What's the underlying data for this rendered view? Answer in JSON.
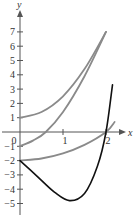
{
  "chart_data": {
    "type": "line",
    "title": "",
    "xlabel": "x",
    "ylabel": "y",
    "xlim": [
      0,
      2.3
    ],
    "ylim": [
      -5.5,
      7.8
    ],
    "x_ticks": [
      0,
      1,
      2
    ],
    "x_tick_labels": [
      "0",
      "1",
      "2"
    ],
    "y_ticks": [
      -5,
      -4,
      -3,
      -2,
      -1,
      1,
      2,
      3,
      4,
      5,
      6,
      7
    ],
    "y_tick_labels": [
      "−5",
      "−4",
      "−3",
      "−2",
      "−1",
      "1",
      "2",
      "3",
      "4",
      "5",
      "6",
      "7"
    ],
    "grid": false,
    "legend": null,
    "series": [
      {
        "name": "gray curve starting at 1",
        "color": "#8a8a8a",
        "points": [
          [
            0,
            1
          ],
          [
            0.5,
            1.4
          ],
          [
            1,
            2.5
          ],
          [
            1.5,
            4.4
          ],
          [
            2,
            7
          ]
        ]
      },
      {
        "name": "gray curve starting at -1",
        "color": "#8a8a8a",
        "points": [
          [
            0,
            -1
          ],
          [
            0.3,
            -0.6
          ],
          [
            0.6,
            0
          ],
          [
            1,
            1.4
          ],
          [
            1.5,
            3.9
          ],
          [
            2,
            7
          ]
        ]
      },
      {
        "name": "gray curve starting at -2",
        "color": "#8a8a8a",
        "points": [
          [
            0,
            -2
          ],
          [
            0.5,
            -1.85
          ],
          [
            1,
            -1.5
          ],
          [
            1.5,
            -0.9
          ],
          [
            2,
            0
          ],
          [
            2.2,
            0.7
          ]
        ]
      },
      {
        "name": "black curve",
        "color": "#111111",
        "points": [
          [
            0,
            -2
          ],
          [
            0.4,
            -3.1
          ],
          [
            0.8,
            -4.2
          ],
          [
            1.15,
            -4.8
          ],
          [
            1.5,
            -4.3
          ],
          [
            1.8,
            -2.4
          ],
          [
            2,
            0
          ],
          [
            2.15,
            3.3
          ]
        ]
      }
    ]
  }
}
